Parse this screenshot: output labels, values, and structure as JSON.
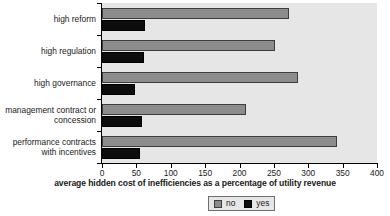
{
  "chart_data": {
    "type": "bar",
    "orientation": "horizontal",
    "title": "",
    "xlabel": "average hidden cost of inefficiencies as a percentage of utility revenue",
    "ylabel": "",
    "xlim": [
      0,
      400
    ],
    "xticks": [
      0,
      50,
      100,
      150,
      200,
      250,
      300,
      350,
      400
    ],
    "grid": false,
    "legend_position": "bottom-center",
    "categories": [
      "high reform",
      "high regulation",
      "high governance",
      "management contract or concession",
      "performance contracts with incentives"
    ],
    "series": [
      {
        "name": "no",
        "color": "#8c8c8c",
        "values": [
          272,
          252,
          285,
          209,
          342
        ]
      },
      {
        "name": "yes",
        "color": "#0d0d0d",
        "values": [
          63,
          61,
          48,
          58,
          55
        ]
      }
    ]
  },
  "category_labels": [
    [
      "high reform"
    ],
    [
      "high regulation"
    ],
    [
      "high governance"
    ],
    [
      "management contract or",
      "concession"
    ],
    [
      "performance contracts",
      "with incentives"
    ]
  ],
  "legend": {
    "items": [
      {
        "label": "no"
      },
      {
        "label": "yes"
      }
    ]
  },
  "axis": {
    "x_title": "average hidden cost of inefficiencies as a percentage of utility revenue",
    "tick_labels": [
      "0",
      "50",
      "100",
      "150",
      "200",
      "250",
      "300",
      "350",
      "400"
    ]
  },
  "colors": {
    "plot_background": "#e6e6e6",
    "page_background": "#ffffff",
    "bar_no": "#8c8c8c",
    "bar_yes": "#0d0d0d",
    "axis": "#000000",
    "text": "#1a1a1a"
  }
}
